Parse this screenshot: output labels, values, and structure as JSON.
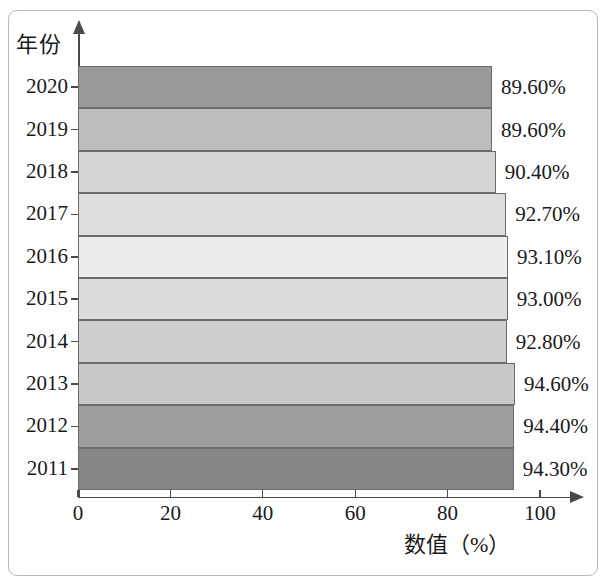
{
  "chart_data": {
    "type": "bar",
    "orientation": "horizontal",
    "title": "",
    "xlabel": "数值（%）",
    "ylabel": "年份",
    "xlim": [
      0,
      100
    ],
    "xticks": [
      "0",
      "20",
      "40",
      "60",
      "80",
      "100"
    ],
    "grid": false,
    "legend": null,
    "categories": [
      "2020",
      "2019",
      "2018",
      "2017",
      "2016",
      "2015",
      "2014",
      "2013",
      "2012",
      "2011"
    ],
    "values": [
      89.6,
      89.6,
      90.4,
      92.7,
      93.1,
      93.0,
      92.8,
      94.6,
      94.4,
      94.3
    ],
    "data_labels": [
      "89.60%",
      "89.60%",
      "90.40%",
      "92.70%",
      "93.10%",
      "93.00%",
      "92.80%",
      "94.60%",
      "94.40%",
      "94.30%"
    ],
    "bar_colors": [
      "#9a9a9a",
      "#bdbdbd",
      "#d6d6d6",
      "#dedede",
      "#ededed",
      "#dcdcdc",
      "#cfcfcf",
      "#c8c8c8",
      "#9d9d9d",
      "#878787"
    ],
    "bar_border_color": "#6b6b6b",
    "axis_color": "#4a4a4a",
    "frame_color": "#b9b9b9",
    "points": [
      {
        "year": "2020",
        "value": 89.6,
        "label": "89.60%",
        "color": "#9a9a9a"
      },
      {
        "year": "2019",
        "value": 89.6,
        "label": "89.60%",
        "color": "#bdbdbd"
      },
      {
        "year": "2018",
        "value": 90.4,
        "label": "90.40%",
        "color": "#d6d6d6"
      },
      {
        "year": "2017",
        "value": 92.7,
        "label": "92.70%",
        "color": "#dedede"
      },
      {
        "year": "2016",
        "value": 93.1,
        "label": "93.10%",
        "color": "#ededed"
      },
      {
        "year": "2015",
        "value": 93.0,
        "label": "93.00%",
        "color": "#dcdcdc"
      },
      {
        "year": "2014",
        "value": 92.8,
        "label": "92.80%",
        "color": "#cfcfcf"
      },
      {
        "year": "2013",
        "value": 94.6,
        "label": "94.60%",
        "color": "#c8c8c8"
      },
      {
        "year": "2012",
        "value": 94.4,
        "label": "94.40%",
        "color": "#9d9d9d"
      },
      {
        "year": "2011",
        "value": 94.3,
        "label": "94.30%",
        "color": "#878787"
      }
    ]
  },
  "axes": {
    "y_title": "年份",
    "x_title": "数值（%）",
    "x_tick_labels": [
      "0",
      "20",
      "40",
      "60",
      "80",
      "100"
    ],
    "x_tick_values": [
      0,
      20,
      40,
      60,
      80,
      100
    ]
  }
}
